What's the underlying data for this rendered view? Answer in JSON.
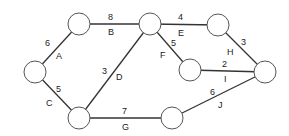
{
  "diagram": {
    "type": "network",
    "nodes": [
      {
        "id": "n1",
        "x": 35,
        "y": 72
      },
      {
        "id": "n2",
        "x": 79,
        "y": 24
      },
      {
        "id": "n3",
        "x": 150,
        "y": 24
      },
      {
        "id": "n4",
        "x": 79,
        "y": 118
      },
      {
        "id": "n5",
        "x": 218,
        "y": 25
      },
      {
        "id": "n6",
        "x": 190,
        "y": 70
      },
      {
        "id": "n7",
        "x": 265,
        "y": 72
      },
      {
        "id": "n8",
        "x": 172,
        "y": 118
      }
    ],
    "edges": [
      {
        "name": "A",
        "weight": "6",
        "from": "n1",
        "to": "n2"
      },
      {
        "name": "B",
        "weight": "8",
        "from": "n2",
        "to": "n3"
      },
      {
        "name": "C",
        "weight": "5",
        "from": "n1",
        "to": "n4"
      },
      {
        "name": "D",
        "weight": "3",
        "from": "n4",
        "to": "n3"
      },
      {
        "name": "E",
        "weight": "4",
        "from": "n3",
        "to": "n5"
      },
      {
        "name": "F",
        "weight": "5",
        "from": "n3",
        "to": "n6"
      },
      {
        "name": "G",
        "weight": "7",
        "from": "n4",
        "to": "n8"
      },
      {
        "name": "H",
        "weight": "3",
        "from": "n5",
        "to": "n7"
      },
      {
        "name": "I",
        "weight": "2",
        "from": "n6",
        "to": "n7"
      },
      {
        "name": "J",
        "weight": "6",
        "from": "n8",
        "to": "n7"
      }
    ]
  },
  "labels": {
    "A": {
      "name": "A",
      "weight": "6"
    },
    "B": {
      "name": "B",
      "weight": "8"
    },
    "C": {
      "name": "C",
      "weight": "5"
    },
    "D": {
      "name": "D",
      "weight": "3"
    },
    "E": {
      "name": "E",
      "weight": "4"
    },
    "F": {
      "name": "F",
      "weight": "5"
    },
    "G": {
      "name": "G",
      "weight": "7"
    },
    "H": {
      "name": "H",
      "weight": "3"
    },
    "I": {
      "name": "I",
      "weight": "2"
    },
    "J": {
      "name": "J",
      "weight": "6"
    }
  }
}
